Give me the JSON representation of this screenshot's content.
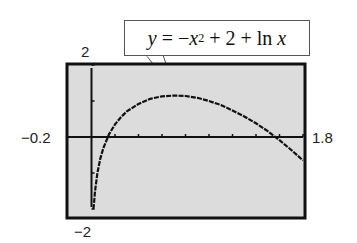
{
  "chart_data": {
    "type": "line",
    "equation_label": {
      "y": "y",
      "eq": " = −",
      "x1": "x",
      "exp": "2",
      "rest": " + 2 + ln ",
      "x2": "x"
    },
    "xlabel": "",
    "ylabel": "",
    "xlim": [
      -0.2,
      1.8
    ],
    "ylim": [
      -2,
      2
    ],
    "x_tick_step": 0.2,
    "y_tick_step": 1,
    "grid": false,
    "legend": null,
    "window_labels": {
      "xmin": "−0.2",
      "xmax": "1.8",
      "ymin": "−2",
      "ymax": "2"
    },
    "series": [
      {
        "name": "y = -x^2 + 2 + ln x",
        "x": [
          0.015,
          0.02,
          0.03,
          0.05,
          0.075,
          0.1,
          0.15,
          0.2,
          0.25,
          0.3,
          0.4,
          0.5,
          0.6,
          0.7,
          0.8,
          0.9,
          1.0,
          1.1,
          1.2,
          1.3,
          1.4,
          1.5,
          1.6,
          1.7,
          1.8
        ],
        "y": [
          -2.0,
          -1.91,
          -1.51,
          -1.0,
          -0.6,
          -0.31,
          0.08,
          0.35,
          0.55,
          0.71,
          0.92,
          1.06,
          1.13,
          1.15,
          1.14,
          1.09,
          1.0,
          0.89,
          0.74,
          0.57,
          0.38,
          0.16,
          -0.09,
          -0.36,
          -0.65
        ]
      }
    ],
    "colors": {
      "screen_bg": "#dcdcdc",
      "frame": "#111111",
      "curve": "#111111",
      "axis": "#111111"
    }
  }
}
